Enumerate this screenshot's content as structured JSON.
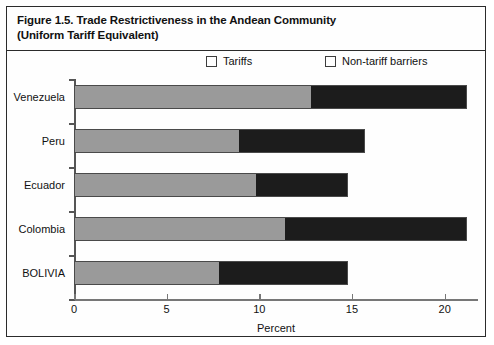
{
  "figure": {
    "title_line1": "Figure 1.5. Trade Restrictiveness in the Andean Community",
    "title_line2": "(Uniform Tariff Equivalent)"
  },
  "colors": {
    "tariffs": "#9a9a9a",
    "non_tariff_barriers": "#1c1c1c",
    "frame": "#2b2b2b",
    "axis": "#777777",
    "text": "#111111"
  },
  "chart_data": {
    "type": "bar",
    "orientation": "horizontal",
    "stacked": true,
    "title": "Figure 1.5. Trade Restrictiveness in the Andean Community (Uniform Tariff Equivalent)",
    "xlabel": "Percent",
    "ylabel": "",
    "xlim": [
      0,
      21.8
    ],
    "xticks": [
      0,
      5,
      10,
      15,
      20
    ],
    "xtick_labels": [
      "0",
      "5",
      "10",
      "15",
      "20"
    ],
    "grid": false,
    "legend_position": "top",
    "categories": [
      "Venezuela",
      "Peru",
      "Ecuador",
      "Colombia",
      "BOLIVIA"
    ],
    "series": [
      {
        "name": "Tariffs",
        "color": "#9a9a9a",
        "values": [
          12.8,
          8.9,
          9.8,
          11.4,
          7.8
        ]
      },
      {
        "name": "Non-tariff barriers",
        "color": "#1c1c1c",
        "values": [
          8.4,
          6.8,
          5.0,
          9.8,
          7.0
        ]
      }
    ],
    "totals": [
      21.2,
      15.7,
      14.8,
      21.2,
      14.8
    ]
  }
}
